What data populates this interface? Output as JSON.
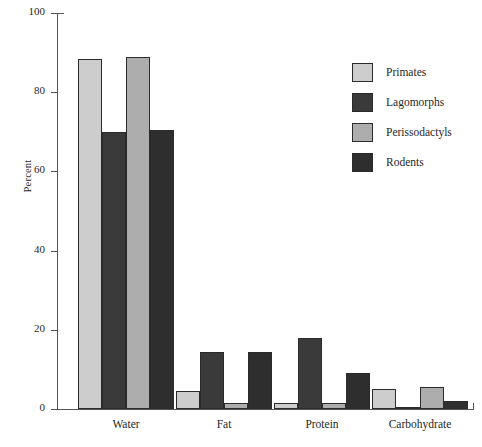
{
  "chart_data": {
    "type": "bar",
    "title": "",
    "xlabel": "",
    "ylabel": "Percent",
    "ylim": [
      0,
      100
    ],
    "yticks": [
      0,
      20,
      40,
      60,
      80,
      100
    ],
    "grid": false,
    "legend_position": "upper right",
    "categories": [
      "Water",
      "Fat",
      "Protein",
      "Carbohydrate"
    ],
    "series": [
      {
        "name": "Primates",
        "color": "#cdcdcd",
        "values": [
          88.5,
          4.5,
          1.5,
          5.0
        ]
      },
      {
        "name": "Lagomorphs",
        "color": "#3a3a3a",
        "values": [
          70.0,
          14.5,
          18.0,
          0.5
        ]
      },
      {
        "name": "Perissodactyls",
        "color": "#adadad",
        "values": [
          89.0,
          1.5,
          1.5,
          5.5
        ]
      },
      {
        "name": "Rodents",
        "color": "#2e2e2e",
        "values": [
          70.5,
          14.5,
          9.0,
          2.0
        ]
      }
    ]
  }
}
